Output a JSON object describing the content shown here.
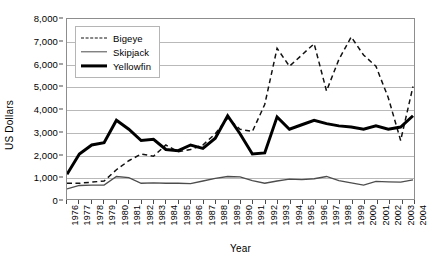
{
  "chart_data": {
    "type": "line",
    "title": "",
    "xlabel": "Year",
    "ylabel": "US Dollars",
    "ylim": [
      0,
      8000
    ],
    "ytick_labels": [
      "0",
      "1,000",
      "2,000",
      "3,000",
      "4,000",
      "5,000",
      "6,000",
      "7,000",
      "8,000"
    ],
    "ytick_values": [
      0,
      1000,
      2000,
      3000,
      4000,
      5000,
      6000,
      7000,
      8000
    ],
    "grid": true,
    "legend_position": "top-left",
    "categories": [
      "1976",
      "1977",
      "1978",
      "1979",
      "1980",
      "1981",
      "1982",
      "1983",
      "1984",
      "1985",
      "1986",
      "1987",
      "1988",
      "1989",
      "1990",
      "1991",
      "1992",
      "1993",
      "1994",
      "1995",
      "1996",
      "1997",
      "1998",
      "1999",
      "2000",
      "2001",
      "2002",
      "2003",
      "2004"
    ],
    "series": [
      {
        "name": "Bigeye",
        "style": "dashed",
        "color": "#111111",
        "values": [
          700,
          700,
          750,
          800,
          1300,
          1700,
          2000,
          1900,
          2400,
          2100,
          2200,
          2400,
          2900,
          3600,
          3100,
          3000,
          4200,
          6700,
          5900,
          6400,
          6900,
          4800,
          6200,
          7200,
          6400,
          5900,
          4500,
          2600,
          5000
        ]
      },
      {
        "name": "Skipjack",
        "style": "solid-thin",
        "color": "#4d4d4d",
        "values": [
          450,
          600,
          620,
          620,
          1000,
          950,
          700,
          720,
          700,
          700,
          680,
          800,
          920,
          1000,
          980,
          820,
          700,
          800,
          880,
          860,
          900,
          1000,
          820,
          720,
          620,
          780,
          760,
          750,
          850
        ]
      },
      {
        "name": "Yellowfin",
        "style": "solid-thick",
        "color": "#000000",
        "values": [
          1100,
          2000,
          2400,
          2500,
          3500,
          3100,
          2600,
          2650,
          2200,
          2150,
          2400,
          2250,
          2700,
          3700,
          2900,
          2000,
          2050,
          3650,
          3100,
          3300,
          3500,
          3350,
          3250,
          3200,
          3100,
          3250,
          3100,
          3200,
          3700
        ]
      }
    ]
  },
  "legend": {
    "items": [
      {
        "label": "Bigeye"
      },
      {
        "label": "Skipjack"
      },
      {
        "label": "Yellowfin"
      }
    ]
  }
}
